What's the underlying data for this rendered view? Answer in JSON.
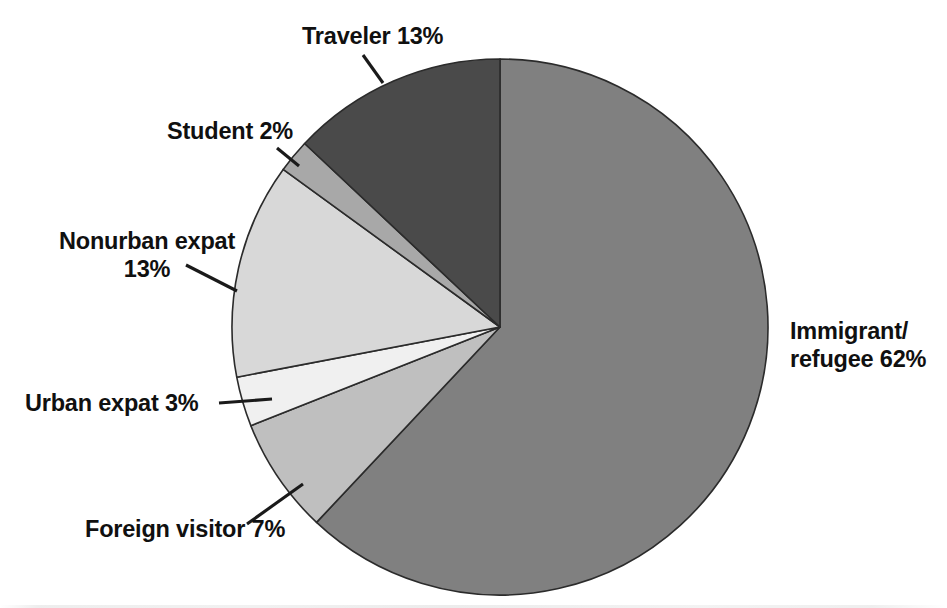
{
  "chart_data": {
    "type": "pie",
    "title": "",
    "subtitle": "",
    "xlabel": "",
    "ylabel": "",
    "legend_position": "none",
    "grid": false,
    "units": "percent",
    "total": 100,
    "start_angle_deg": 0,
    "direction": "clockwise",
    "categories": [
      "Immigrant/refugee",
      "Foreign visitor",
      "Urban expat",
      "Nonurban expat",
      "Student",
      "Traveler"
    ],
    "values": [
      62,
      7,
      3,
      13,
      2,
      13
    ],
    "slices": [
      {
        "name": "Immigrant/refugee",
        "value": 62,
        "label": "Immigrant/\nrefugee 62%",
        "label_line1": "Immigrant/",
        "label_line2": "refugee 62%",
        "percent_text": "62%",
        "color": "#808080",
        "start_deg": 0,
        "end_deg": 223.2,
        "label_x": 790,
        "label_y": 339,
        "label_anchor": "start",
        "has_leader": false
      },
      {
        "name": "Foreign visitor",
        "value": 7,
        "label": "Foreign visitor 7%",
        "percent_text": "7%",
        "color": "#bfbfbf",
        "start_deg": 223.2,
        "end_deg": 248.4,
        "label_x": 85,
        "label_y": 537,
        "label_anchor": "start",
        "has_leader": true,
        "leader_x1": 247,
        "leader_y1": 524,
        "leader_x2": 303,
        "leader_y2": 484
      },
      {
        "name": "Urban expat",
        "value": 3,
        "label": "Urban expat 3%",
        "percent_text": "3%",
        "color": "#f0f0f0",
        "start_deg": 248.4,
        "end_deg": 259.2,
        "label_x": 25,
        "label_y": 411,
        "label_anchor": "start",
        "has_leader": true,
        "leader_x1": 219,
        "leader_y1": 403,
        "leader_x2": 272,
        "leader_y2": 399
      },
      {
        "name": "Nonurban expat",
        "value": 13,
        "label": "Nonurban expat 13%",
        "label_line1": "Nonurban expat",
        "label_line2": "13%",
        "percent_text": "13%",
        "color": "#d8d8d8",
        "start_deg": 259.2,
        "end_deg": 306.0,
        "label_x": 147,
        "label_y": 249,
        "label_anchor": "middle",
        "has_leader": true,
        "leader_x1": 186,
        "leader_y1": 265,
        "leader_x2": 237,
        "leader_y2": 291
      },
      {
        "name": "Student",
        "value": 2,
        "label": "Student 2%",
        "percent_text": "2%",
        "color": "#a8a8a8",
        "start_deg": 306.0,
        "end_deg": 313.2,
        "label_x": 167,
        "label_y": 139,
        "label_anchor": "start",
        "has_leader": true,
        "leader_x1": 277,
        "leader_y1": 148,
        "leader_x2": 299,
        "leader_y2": 166
      },
      {
        "name": "Traveler",
        "value": 13,
        "label": "Traveler 13%",
        "percent_text": "13%",
        "color": "#4a4a4a",
        "start_deg": 313.2,
        "end_deg": 360.0,
        "label_x": 302,
        "label_y": 44,
        "label_anchor": "start",
        "has_leader": true,
        "leader_x1": 363,
        "leader_y1": 55,
        "leader_x2": 383,
        "leader_y2": 83
      }
    ],
    "geometry": {
      "center_x": 500,
      "center_y": 327,
      "radius": 268
    }
  }
}
